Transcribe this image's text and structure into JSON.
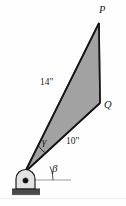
{
  "figure": {
    "vertices": [
      {
        "id": "P",
        "label": "P",
        "x": 99,
        "y": 22
      },
      {
        "id": "Q",
        "label": "Q",
        "x": 100,
        "y": 103
      },
      {
        "id": "A",
        "label": "",
        "x": 25,
        "y": 172
      }
    ],
    "dimensions": [
      {
        "name": "side-PA",
        "label": "14\"",
        "value": 14,
        "unit": "in"
      },
      {
        "name": "side-QA",
        "label": "10\"",
        "value": 10,
        "unit": "in"
      }
    ],
    "angles": [
      {
        "name": "gamma",
        "label": "γ",
        "between": "14\" side and 10\" side"
      },
      {
        "name": "beta",
        "label": "β",
        "between": "10\" side and horizontal"
      }
    ],
    "support": {
      "type": "pin-support",
      "name": "pinned-support",
      "hatched_ground": true
    },
    "colors": {
      "plate_fill": "#a0a0a0",
      "plate_stroke": "#1f1f1f",
      "line": "#2b2b2b",
      "reference_line": "#8f8f8f",
      "background": "#fefefe"
    },
    "geometry": {
      "plate_points": "25,172 99,22 100,103",
      "reference_line": {
        "x1": 27,
        "y1": 180,
        "x2": 71,
        "y2": 180
      }
    }
  }
}
